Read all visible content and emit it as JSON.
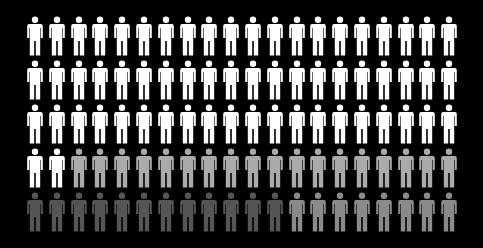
{
  "chart_data": {
    "type": "pictogram",
    "title": "",
    "total": 100,
    "grid": {
      "rows": 5,
      "columns": 20
    },
    "icon": "person-icon",
    "fill_order": "row-major",
    "series": [
      {
        "name": "group-1",
        "count": 62,
        "color": "#ffffff"
      },
      {
        "name": "group-2",
        "count": 18,
        "color": "#aaaaaa"
      },
      {
        "name": "group-3",
        "count": 12,
        "color": "#555555"
      },
      {
        "name": "group-4",
        "count": 8,
        "color": "#8a8a8a"
      }
    ],
    "background": "#000000",
    "legend": "none",
    "axes": "none"
  },
  "layout": {
    "origin_x": 26,
    "origin_y": 16,
    "col_step": 21.8,
    "row_step": 44
  }
}
